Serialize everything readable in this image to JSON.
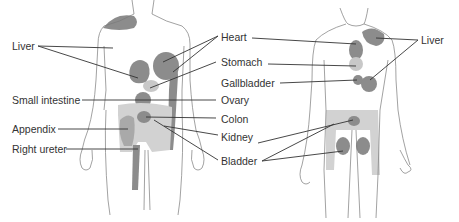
{
  "figure": {
    "colors": {
      "outline": "#7a7a7a",
      "dark_region": "#8c8c8c",
      "mid_region": "#a9a9a9",
      "light_region": "#d2d2d2",
      "leader": "#333333",
      "text": "#333333"
    },
    "front_view": {
      "labels_left": [
        "Liver",
        "Small intestine",
        "Appendix",
        "Right ureter"
      ],
      "labels_right": [
        "Heart",
        "Stomach",
        "Gallbladder",
        "Ovary",
        "Colon",
        "Kidney",
        "Bladder"
      ]
    },
    "back_view": {
      "labels_right": [
        "Liver"
      ]
    }
  }
}
